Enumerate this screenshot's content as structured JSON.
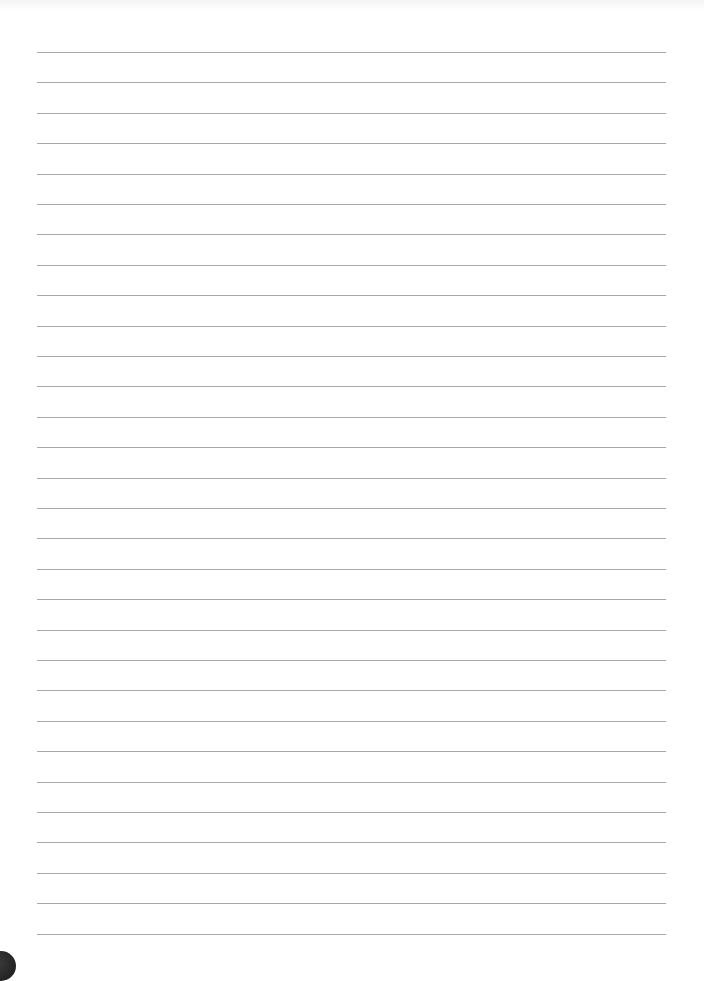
{
  "page": {
    "type": "lined-paper",
    "background_color": "#ffffff",
    "rule_color": "#a9a9a9",
    "rule_count": 30,
    "rule_start_y": 52,
    "rule_spacing": 30.4,
    "rule_left_x": 37,
    "rule_right_x": 666,
    "text": ""
  },
  "corner_mark": {
    "color": "#1f1f1f",
    "position": "bottom-left"
  }
}
